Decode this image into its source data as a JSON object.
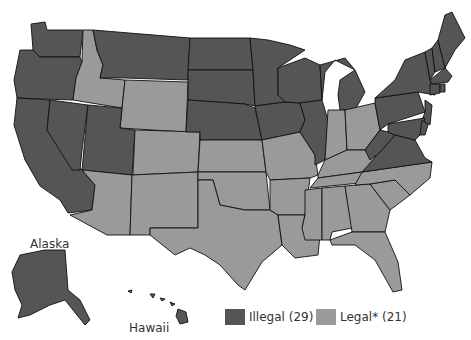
{
  "colors": {
    "illegal": "#555555",
    "legal": "#9a9a9a",
    "border": "#111111",
    "background": "#ffffff"
  },
  "labels": {
    "alaska": "Alaska",
    "hawaii": "Hawaii"
  },
  "legend": [
    {
      "key": "illegal",
      "label": "Illegal (29)",
      "color": "#555555"
    },
    {
      "key": "legal",
      "label": "Legal* (21)",
      "color": "#9a9a9a"
    }
  ],
  "states": {
    "illegal": [
      "WA",
      "OR",
      "CA",
      "NV",
      "UT",
      "MT",
      "ND",
      "SD",
      "NE",
      "MN",
      "IA",
      "WI",
      "IL",
      "MI",
      "NY",
      "PA",
      "NJ",
      "WV",
      "VA",
      "MD",
      "DE",
      "CT",
      "RI",
      "MA",
      "VT",
      "NH",
      "ME",
      "AK",
      "HI"
    ],
    "legal": [
      "ID",
      "WY",
      "CO",
      "AZ",
      "NM",
      "TX",
      "OK",
      "KS",
      "MO",
      "AR",
      "LA",
      "MS",
      "AL",
      "GA",
      "FL",
      "SC",
      "NC",
      "TN",
      "KY",
      "IN",
      "OH"
    ]
  }
}
